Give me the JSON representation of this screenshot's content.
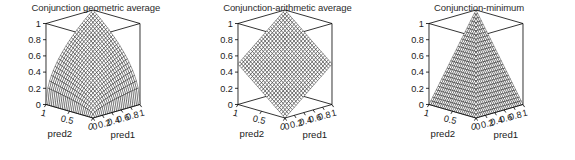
{
  "figure": {
    "background_color": "#ffffff",
    "width": 575,
    "height": 160,
    "panel_count": 3
  },
  "chart_data": [
    {
      "type": "surface",
      "title": "Conjunction geometric average",
      "xlabel": "pred1",
      "ylabel": "pred2",
      "zlabel": "",
      "formula": "sqrt(pred1 * pred2)",
      "xlim": [
        0,
        1
      ],
      "ylim": [
        0,
        1
      ],
      "zlim": [
        0,
        1
      ],
      "xticks": [
        "0",
        "0.2",
        "0.4",
        "0.6",
        "0.8",
        "1"
      ],
      "xtick_values": [
        0,
        0.2,
        0.4,
        0.6,
        0.8,
        1
      ],
      "yticks": [
        "1",
        "0.5",
        "0"
      ],
      "ytick_values": [
        1,
        0.5,
        0
      ],
      "zticks": [
        "0",
        "0.2",
        "0.4",
        "0.6",
        "0.8",
        "1"
      ],
      "ztick_values": [
        0,
        0.2,
        0.4,
        0.6,
        0.8,
        1
      ],
      "grid": false,
      "legend": "none",
      "mesh_color": "#000000",
      "surface_color": "#ffffff",
      "corner_values": {
        "x0_y0": 0,
        "x1_y0": 0,
        "x0_y1": 0,
        "x1_y1": 1
      },
      "sample_values": [
        {
          "x": 0.0,
          "y": 0.0,
          "z": 0.0
        },
        {
          "x": 0.5,
          "y": 0.5,
          "z": 0.5
        },
        {
          "x": 1.0,
          "y": 1.0,
          "z": 1.0
        },
        {
          "x": 1.0,
          "y": 0.0,
          "z": 0.0
        },
        {
          "x": 0.0,
          "y": 1.0,
          "z": 0.0
        },
        {
          "x": 0.25,
          "y": 1.0,
          "z": 0.5
        },
        {
          "x": 1.0,
          "y": 0.25,
          "z": 0.5
        }
      ]
    },
    {
      "type": "surface",
      "title": "Conjunction-arithmetic average",
      "xlabel": "pred1",
      "ylabel": "pred2",
      "zlabel": "",
      "formula": "(pred1 + pred2) / 2",
      "xlim": [
        0,
        1
      ],
      "ylim": [
        0,
        1
      ],
      "zlim": [
        0,
        1
      ],
      "xticks": [
        "0",
        "0.2",
        "0.4",
        "0.6",
        "0.8",
        "1"
      ],
      "xtick_values": [
        0,
        0.2,
        0.4,
        0.6,
        0.8,
        1
      ],
      "yticks": [
        "1",
        "0.5",
        "0"
      ],
      "ytick_values": [
        1,
        0.5,
        0
      ],
      "zticks": [
        "0",
        "0.2",
        "0.4",
        "0.6",
        "0.8",
        "1"
      ],
      "ztick_values": [
        0,
        0.2,
        0.4,
        0.6,
        0.8,
        1
      ],
      "grid": false,
      "legend": "none",
      "mesh_color": "#000000",
      "surface_color": "#ffffff",
      "corner_values": {
        "x0_y0": 0,
        "x1_y0": 0.5,
        "x0_y1": 0.5,
        "x1_y1": 1
      },
      "sample_values": [
        {
          "x": 0.0,
          "y": 0.0,
          "z": 0.0
        },
        {
          "x": 0.5,
          "y": 0.5,
          "z": 0.5
        },
        {
          "x": 1.0,
          "y": 1.0,
          "z": 1.0
        },
        {
          "x": 1.0,
          "y": 0.0,
          "z": 0.5
        },
        {
          "x": 0.0,
          "y": 1.0,
          "z": 0.5
        }
      ]
    },
    {
      "type": "surface",
      "title": "Conjunction-minimum",
      "xlabel": "pred1",
      "ylabel": "pred2",
      "zlabel": "",
      "formula": "min(pred1, pred2)",
      "xlim": [
        0,
        1
      ],
      "ylim": [
        0,
        1
      ],
      "zlim": [
        0,
        1
      ],
      "xticks": [
        "0",
        "0.2",
        "0.4",
        "0.6",
        "0.8",
        "1"
      ],
      "xtick_values": [
        0,
        0.2,
        0.4,
        0.6,
        0.8,
        1
      ],
      "yticks": [
        "1",
        "0.5",
        "0"
      ],
      "ytick_values": [
        1,
        0.5,
        0
      ],
      "zticks": [
        "0",
        "0.2",
        "0.4",
        "0.6",
        "0.8",
        "1"
      ],
      "ztick_values": [
        0,
        0.2,
        0.4,
        0.6,
        0.8,
        1
      ],
      "grid": false,
      "legend": "none",
      "mesh_color": "#000000",
      "surface_color": "#ffffff",
      "corner_values": {
        "x0_y0": 0,
        "x1_y0": 0,
        "x0_y1": 0,
        "x1_y1": 1
      },
      "sample_values": [
        {
          "x": 0.0,
          "y": 0.0,
          "z": 0.0
        },
        {
          "x": 0.5,
          "y": 0.5,
          "z": 0.5
        },
        {
          "x": 1.0,
          "y": 1.0,
          "z": 1.0
        },
        {
          "x": 1.0,
          "y": 0.0,
          "z": 0.0
        },
        {
          "x": 0.0,
          "y": 1.0,
          "z": 0.0
        }
      ]
    }
  ],
  "panels": [
    {
      "id": "geometric-average",
      "title": "Conjunction geometric average",
      "xlabel": "pred1",
      "ylabel": "pred2",
      "xticks": [
        "0",
        "0.2",
        "0.4",
        "0.6",
        "0.8",
        "1"
      ],
      "yticks": [
        "1",
        "0.5",
        "0"
      ],
      "zticks": [
        "1",
        "0.8",
        "0.6",
        "0.4",
        "0.2",
        "0"
      ]
    },
    {
      "id": "arithmetic-average",
      "title": "Conjunction-arithmetic average",
      "xlabel": "pred1",
      "ylabel": "pred2",
      "xticks": [
        "0",
        "0.2",
        "0.4",
        "0.6",
        "0.8",
        "1"
      ],
      "yticks": [
        "1",
        "0.5",
        "0"
      ],
      "zticks": [
        "1",
        "0.8",
        "0.6",
        "0.4",
        "0.2",
        "0"
      ]
    },
    {
      "id": "minimum",
      "title": "Conjunction-minimum",
      "xlabel": "pred1",
      "ylabel": "pred2",
      "xticks": [
        "0",
        "0.2",
        "0.4",
        "0.6",
        "0.8",
        "1"
      ],
      "yticks": [
        "1",
        "0.5",
        "0"
      ],
      "zticks": [
        "1",
        "0.8",
        "0.6",
        "0.4",
        "0.2",
        "0"
      ]
    }
  ]
}
